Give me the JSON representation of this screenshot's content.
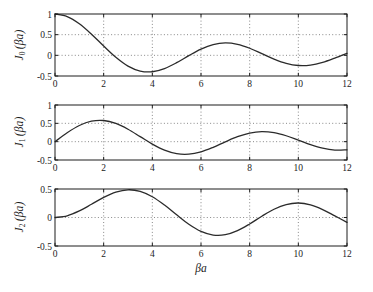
{
  "figure": {
    "background": "#ffffff",
    "axis_color": "#1c1c1c",
    "curve_color": "#2b2b2b",
    "grid_color": "#6b6b6b",
    "tick_label_color": "#1c1c1c",
    "xlabel": "βa"
  },
  "chart_data": [
    {
      "type": "line",
      "series_name": "J0(βa)",
      "ylabel": {
        "func": "J",
        "sub": "0",
        "arg": "(βa)"
      },
      "xlabel": "",
      "xlim": [
        0,
        12
      ],
      "ylim": [
        -0.5,
        1
      ],
      "xticks": [
        0,
        2,
        4,
        6,
        8,
        10,
        12
      ],
      "yticks": [
        1,
        0.5,
        0,
        -0.5
      ],
      "grid": true,
      "x": [
        0,
        0.5,
        1,
        1.5,
        2,
        2.5,
        3,
        3.5,
        4,
        4.5,
        5,
        5.5,
        6,
        6.5,
        7,
        7.5,
        8,
        8.5,
        9,
        9.5,
        10,
        10.5,
        11,
        11.5,
        12
      ],
      "y": [
        1.0,
        0.9385,
        0.7652,
        0.5118,
        0.2239,
        -0.0484,
        -0.2601,
        -0.3801,
        -0.3971,
        -0.3205,
        -0.1776,
        -0.0068,
        0.1506,
        0.2601,
        0.3001,
        0.2663,
        0.1717,
        0.0419,
        -0.0903,
        -0.1939,
        -0.2459,
        -0.2366,
        -0.1712,
        -0.0677,
        0.0477
      ]
    },
    {
      "type": "line",
      "series_name": "J1(βa)",
      "ylabel": {
        "func": "J",
        "sub": "1",
        "arg": "(βa)"
      },
      "xlabel": "",
      "xlim": [
        0,
        12
      ],
      "ylim": [
        -0.5,
        1
      ],
      "xticks": [
        0,
        2,
        4,
        6,
        8,
        10,
        12
      ],
      "yticks": [
        1,
        0.5,
        0,
        -0.5
      ],
      "grid": true,
      "x": [
        0,
        0.5,
        1,
        1.5,
        2,
        2.5,
        3,
        3.5,
        4,
        4.5,
        5,
        5.5,
        6,
        6.5,
        7,
        7.5,
        8,
        8.5,
        9,
        9.5,
        10,
        10.5,
        11,
        11.5,
        12
      ],
      "y": [
        0.0,
        0.2423,
        0.4401,
        0.5579,
        0.5767,
        0.4971,
        0.3391,
        0.1374,
        -0.066,
        -0.2311,
        -0.3276,
        -0.3414,
        -0.2767,
        -0.1538,
        -0.0047,
        0.1352,
        0.2346,
        0.2731,
        0.2453,
        0.1613,
        0.0435,
        -0.0789,
        -0.1768,
        -0.2284,
        -0.2234
      ]
    },
    {
      "type": "line",
      "series_name": "J2(βa)",
      "ylabel": {
        "func": "J",
        "sub": "2",
        "arg": "(βa)"
      },
      "xlabel": "βa",
      "xlim": [
        0,
        12
      ],
      "ylim": [
        -0.5,
        0.5
      ],
      "xticks": [
        0,
        2,
        4,
        6,
        8,
        10,
        12
      ],
      "yticks": [
        0.5,
        0,
        -0.5
      ],
      "grid": true,
      "x": [
        0,
        0.5,
        1,
        1.5,
        2,
        2.5,
        3,
        3.5,
        4,
        4.5,
        5,
        5.5,
        6,
        6.5,
        7,
        7.5,
        8,
        8.5,
        9,
        9.5,
        10,
        10.5,
        11,
        11.5,
        12
      ],
      "y": [
        0.0,
        0.0306,
        0.1149,
        0.2321,
        0.3528,
        0.4461,
        0.4861,
        0.4586,
        0.3641,
        0.2178,
        0.0466,
        -0.1173,
        -0.2429,
        -0.3074,
        -0.3014,
        -0.2303,
        -0.113,
        0.0223,
        0.1448,
        0.2279,
        0.2546,
        0.2216,
        0.139,
        0.0279,
        -0.0849
      ]
    }
  ]
}
